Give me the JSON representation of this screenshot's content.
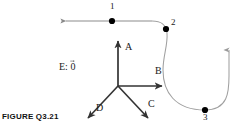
{
  "figure": {
    "caption": "FIGURE Q3.21",
    "background_color": "#ffffff",
    "path_color": "#808080",
    "vector_color": "#333333",
    "dot_color": "#000000",
    "text_color": "#1a1a1a"
  },
  "trajectory": {
    "name": "particle-path",
    "description": "horizontal line then curve down and U-turn upward",
    "start_arrow": "right",
    "end_arrow": "up",
    "points": [
      {
        "label": "1",
        "x": 112,
        "y": 21
      },
      {
        "label": "2",
        "x": 166,
        "y": 29
      },
      {
        "label": "3",
        "x": 205,
        "y": 110
      }
    ],
    "point_labels": [
      {
        "label": "1",
        "lx": 110,
        "ly": 2
      },
      {
        "label": "2",
        "lx": 171,
        "ly": 18
      },
      {
        "label": "3",
        "lx": 203,
        "ly": 114
      }
    ]
  },
  "vectors": {
    "origin": {
      "x": 118,
      "y": 86
    },
    "items": [
      {
        "label": "A",
        "direction": "up",
        "lx": 125,
        "ly": 42
      },
      {
        "label": "B",
        "direction": "right",
        "lx": 155,
        "ly": 66
      },
      {
        "label": "C",
        "direction": "down-right",
        "lx": 148,
        "ly": 99
      },
      {
        "label": "D",
        "direction": "down-left",
        "lx": 96,
        "ly": 104
      }
    ],
    "zero_vector": {
      "prefix": "E:",
      "value": "0",
      "lx": 59,
      "ly": 61
    }
  }
}
